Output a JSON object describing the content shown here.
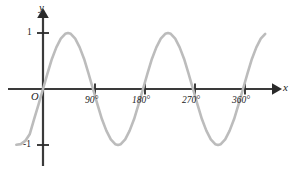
{
  "figure": {
    "background_color": "#ffffff",
    "axis_color": "#3a3a3a",
    "curve_color": "#bcbcbc",
    "text_color": "#1a1a1a"
  },
  "axes": {
    "y_axis_label": "y",
    "x_axis_label": "x",
    "origin_label": "O"
  },
  "ticks": {
    "y": [
      {
        "label": "1",
        "value": 1
      },
      {
        "label": "-1",
        "value": -1
      }
    ],
    "x": [
      {
        "label": "90°",
        "value": 90
      },
      {
        "label": "180°",
        "value": 180
      },
      {
        "label": "270°",
        "value": 270
      },
      {
        "label": "360°",
        "value": 360
      }
    ]
  },
  "chart_data": {
    "type": "line",
    "title": "",
    "xlabel": "x",
    "ylabel": "y",
    "xlim": [
      -48,
      400
    ],
    "ylim": [
      -1.35,
      1.35
    ],
    "grid": false,
    "legend": null,
    "series": [
      {
        "name": "y = sin(2x)",
        "equation": "y = sin(2x)",
        "amplitude": 1,
        "period_degrees": 180,
        "color": "#bcbcbc",
        "x": [
          -48,
          -40,
          -32,
          -24,
          -16,
          -8,
          0,
          8,
          16,
          24,
          32,
          40,
          45,
          50,
          58,
          66,
          74,
          82,
          90,
          98,
          106,
          114,
          122,
          130,
          135,
          140,
          148,
          156,
          164,
          172,
          180,
          188,
          196,
          204,
          212,
          220,
          225,
          230,
          238,
          246,
          254,
          262,
          270,
          278,
          286,
          294,
          302,
          310,
          315,
          320,
          328,
          336,
          344,
          352,
          360,
          368,
          376,
          384,
          392,
          400
        ],
        "y": [
          -0.995,
          -0.985,
          -0.927,
          -0.809,
          -0.537,
          -0.276,
          0.0,
          0.276,
          0.537,
          0.743,
          0.899,
          0.985,
          1.0,
          0.985,
          0.899,
          0.743,
          0.537,
          0.276,
          0.0,
          -0.276,
          -0.537,
          -0.743,
          -0.899,
          -0.985,
          -1.0,
          -0.985,
          -0.899,
          -0.743,
          -0.537,
          -0.276,
          0.0,
          0.276,
          0.537,
          0.743,
          0.899,
          0.985,
          1.0,
          0.985,
          0.899,
          0.743,
          0.537,
          0.276,
          0.0,
          -0.276,
          -0.537,
          -0.743,
          -0.899,
          -0.985,
          -1.0,
          -0.985,
          -0.899,
          -0.743,
          -0.537,
          -0.276,
          0.0,
          0.276,
          0.537,
          0.743,
          0.899,
          0.985
        ]
      }
    ],
    "annotations": [],
    "x_tick_labels": [
      "90°",
      "180°",
      "270°",
      "360°"
    ],
    "x_tick_values": [
      90,
      180,
      270,
      360
    ],
    "y_tick_labels": [
      "1",
      "-1"
    ],
    "y_tick_values": [
      1,
      -1
    ]
  }
}
